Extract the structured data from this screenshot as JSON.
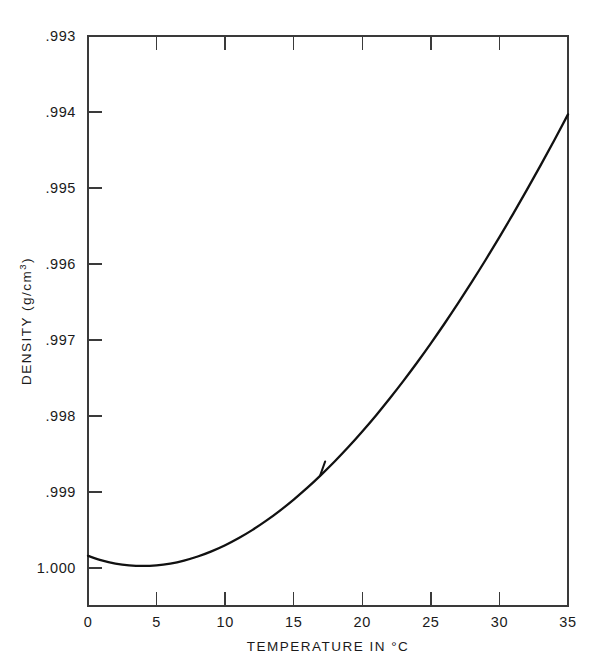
{
  "chart_data": {
    "type": "line",
    "title": "",
    "xlabel": "TEMPERATURE IN °C",
    "ylabel_main": "DENSITY (g/cm",
    "ylabel_exponent": "3",
    "ylabel_close": ")",
    "ylabel_full": "DENSITY (g/cm3)",
    "xlim": [
      0,
      35
    ],
    "ylim": [
      0.993,
      1.0005
    ],
    "y_axis_inverted": true,
    "grid": false,
    "legend": null,
    "xticks": [
      0,
      5,
      10,
      15,
      20,
      25,
      30,
      35
    ],
    "xtick_labels": [
      "0",
      "5",
      "10",
      "15",
      "20",
      "25",
      "30",
      "35"
    ],
    "yticks": [
      0.993,
      0.994,
      0.995,
      0.996,
      0.997,
      0.998,
      0.999,
      1.0
    ],
    "ytick_labels": [
      ".993",
      ".994",
      ".995",
      ".996",
      ".997",
      ".998",
      ".999",
      "1.000"
    ],
    "series": [
      {
        "name": "Density of water",
        "color": "#111111",
        "x": [
          0,
          1,
          2,
          3,
          4,
          5,
          6,
          7,
          8,
          9,
          10,
          11,
          12,
          13,
          14,
          15,
          16,
          17,
          18,
          19,
          20,
          21,
          22,
          23,
          24,
          25,
          26,
          27,
          28,
          29,
          30,
          31,
          32,
          33,
          34,
          35
        ],
        "y": [
          0.999841,
          0.9999,
          0.999941,
          0.999965,
          0.999973,
          0.999965,
          0.999941,
          0.999902,
          0.999849,
          0.999781,
          0.9997,
          0.999605,
          0.999498,
          0.999377,
          0.999244,
          0.999099,
          0.998943,
          0.998774,
          0.998595,
          0.998405,
          0.998203,
          0.997992,
          0.99777,
          0.997538,
          0.997296,
          0.997044,
          0.996783,
          0.996512,
          0.996232,
          0.995944,
          0.995646,
          0.99534,
          0.995025,
          0.994702,
          0.994371,
          0.994031
        ]
      }
    ],
    "annotations": [
      {
        "name": "curve-spur-artifact",
        "x": 17.0,
        "y": 0.99877,
        "description": "small ink spur on curve"
      }
    ],
    "colors": {
      "curve": "#111111",
      "axis": "#3a3a3a",
      "background": "#ffffff"
    }
  },
  "geometry": {
    "plot_left": 88,
    "plot_right": 568,
    "plot_top": 36,
    "plot_bottom": 606
  }
}
